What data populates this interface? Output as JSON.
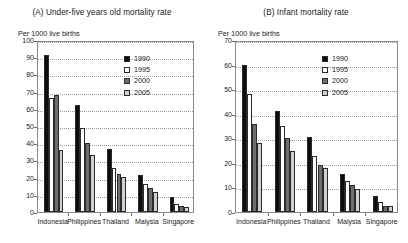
{
  "page": {
    "background": "#ffffff",
    "width": 408,
    "height": 243
  },
  "series_colors": {
    "1990": "#0d0d0d",
    "1995": "#ffffff",
    "2000": "#6e6e6e",
    "2005": "#d0d0d0"
  },
  "panels": [
    {
      "id": "panel-a",
      "title": "(A) Under-five years old mortality rate",
      "unit_label": "Per 1000 live births",
      "legend": [
        "1990",
        "1995",
        "2000",
        "2005"
      ]
    },
    {
      "id": "panel-b",
      "title": "(B) Infant mortality rate",
      "unit_label": "Per 1000 live births",
      "legend": [
        "1990",
        "1995",
        "2000",
        "2005"
      ]
    }
  ],
  "chart_data": [
    {
      "type": "bar",
      "title": "(A) Under-five years old mortality rate",
      "xlabel": "",
      "ylabel": "Per 1000 live births",
      "ylim": [
        0,
        100
      ],
      "yticks": [
        0,
        10,
        20,
        30,
        40,
        50,
        60,
        70,
        80,
        90,
        100
      ],
      "ytick_labels": [
        "0",
        "10",
        "20",
        "30",
        "40",
        "50",
        "60",
        "70",
        "80",
        "90",
        "100"
      ],
      "grid": true,
      "legend_position": "upper right",
      "categories": [
        "Indonesia",
        "Philippines",
        "Thailand",
        "Malysia",
        "Singapore"
      ],
      "series": [
        {
          "name": "1990",
          "values": [
            91,
            62,
            36.5,
            21.5,
            8.5
          ]
        },
        {
          "name": "1995",
          "values": [
            66,
            49,
            25.5,
            16.5,
            4.5
          ]
        },
        {
          "name": "2000",
          "values": [
            68,
            40,
            22,
            14,
            3.5
          ]
        },
        {
          "name": "2005",
          "values": [
            36,
            33,
            20.5,
            11.5,
            3
          ]
        }
      ]
    },
    {
      "type": "bar",
      "title": "(B) Infant mortality rate",
      "xlabel": "",
      "ylabel": "Per 1000 live births",
      "ylim": [
        0,
        70
      ],
      "yticks": [
        0,
        10,
        20,
        30,
        40,
        50,
        60,
        70
      ],
      "ytick_labels": [
        "0",
        "10",
        "20",
        "30",
        "40",
        "50",
        "60",
        "70"
      ],
      "grid": true,
      "legend_position": "upper right",
      "categories": [
        "Indonesia",
        "Philippines",
        "Thailand",
        "Malysia",
        "Singapore"
      ],
      "series": [
        {
          "name": "1990",
          "values": [
            60,
            41,
            30.5,
            15.5,
            6.5
          ]
        },
        {
          "name": "1995",
          "values": [
            48,
            35,
            23,
            12.5,
            4
          ]
        },
        {
          "name": "2000",
          "values": [
            36,
            30,
            19,
            11,
            2.5
          ]
        },
        {
          "name": "2005",
          "values": [
            28,
            25,
            18,
            9.5,
            2.5
          ]
        }
      ]
    }
  ]
}
